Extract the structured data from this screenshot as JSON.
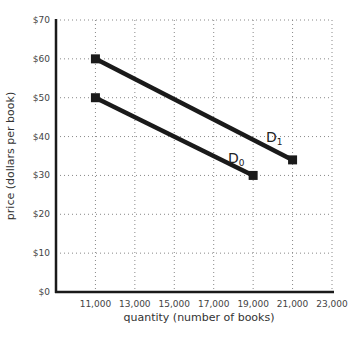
{
  "chart_data": {
    "type": "line",
    "title": "",
    "xlabel": "quantity (number of books)",
    "ylabel": "price (dollars per book)",
    "xlim": [
      9000,
      23000
    ],
    "ylim": [
      0,
      70
    ],
    "x_ticks": [
      11000,
      13000,
      15000,
      17000,
      19000,
      21000,
      23000
    ],
    "x_tick_labels": [
      "11,000",
      "13,000",
      "15,000",
      "17,000",
      "19,000",
      "21,000",
      "23,000"
    ],
    "y_ticks": [
      0,
      10,
      20,
      30,
      40,
      50,
      60,
      70
    ],
    "y_tick_labels": [
      "$0",
      "$10",
      "$20",
      "$30",
      "$40",
      "$50",
      "$60",
      "$70"
    ],
    "grid": true,
    "grid_style": "dotted",
    "legend": "none (curves labeled inline)",
    "series": [
      {
        "name": "D0",
        "label_main": "D",
        "label_sub": "0",
        "x": [
          11000,
          19000
        ],
        "y": [
          50,
          30
        ]
      },
      {
        "name": "D1",
        "label_main": "D",
        "label_sub": "1",
        "x": [
          11000,
          21000
        ],
        "y": [
          60,
          34
        ]
      }
    ],
    "colors": {
      "line": "#1a1a1a",
      "grid": "#888888",
      "axis": "#1a1a1a"
    }
  }
}
